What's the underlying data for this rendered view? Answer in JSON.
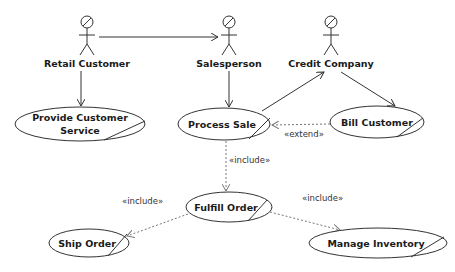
{
  "diagram": {
    "type": "UML use case diagram",
    "actors": [
      {
        "id": "retail-customer",
        "label": "Retail Customer",
        "x": 87,
        "y": 22
      },
      {
        "id": "salesperson",
        "label": "Salesperson",
        "x": 229,
        "y": 22
      },
      {
        "id": "credit-company",
        "label": "Credit Company",
        "x": 331,
        "y": 22
      }
    ],
    "use_cases": [
      {
        "id": "provide-customer-service",
        "label_line1": "Provide Customer",
        "label_line2": "Service",
        "cx": 80,
        "cy": 124,
        "rx": 65,
        "ry": 17
      },
      {
        "id": "process-sale",
        "label": "Process Sale",
        "cx": 224,
        "cy": 124,
        "rx": 46,
        "ry": 16
      },
      {
        "id": "bill-customer",
        "label": "Bill Customer",
        "cx": 377,
        "cy": 122,
        "rx": 47,
        "ry": 16
      },
      {
        "id": "fulfill-order",
        "label": "Fulfill Order",
        "cx": 229,
        "cy": 207,
        "rx": 43,
        "ry": 15
      },
      {
        "id": "ship-order",
        "label": "Ship Order",
        "cx": 89,
        "cy": 243,
        "rx": 40,
        "ry": 14
      },
      {
        "id": "manage-inventory",
        "label": "Manage Inventory",
        "cx": 378,
        "cy": 243,
        "rx": 69,
        "ry": 15
      }
    ],
    "relationships": [
      {
        "from": "Retail Customer",
        "to": "Salesperson",
        "type": "association"
      },
      {
        "from": "Retail Customer",
        "to": "Provide Customer Service",
        "type": "association"
      },
      {
        "from": "Salesperson",
        "to": "Process Sale",
        "type": "association"
      },
      {
        "from": "Process Sale",
        "to": "Credit Company",
        "type": "association"
      },
      {
        "from": "Credit Company",
        "to": "Bill Customer",
        "type": "association"
      },
      {
        "from": "Bill Customer",
        "to": "Process Sale",
        "type": "extend",
        "label": "«extend»"
      },
      {
        "from": "Process Sale",
        "to": "Fulfill Order",
        "type": "include",
        "label": "«include»"
      },
      {
        "from": "Fulfill Order",
        "to": "Ship Order",
        "type": "include",
        "label": "«include»"
      },
      {
        "from": "Fulfill Order",
        "to": "Manage Inventory",
        "type": "include",
        "label": "«include»"
      }
    ],
    "labels": {
      "extend": "«extend»",
      "include_process_fulfill": "«include»",
      "include_fulfill_ship": "«include»",
      "include_fulfill_inventory": "«include»"
    }
  }
}
